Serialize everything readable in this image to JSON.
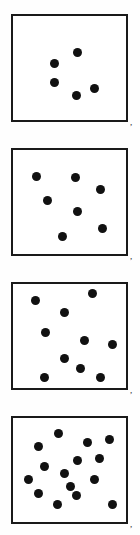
{
  "figure": {
    "title": "Dot density stimulus panels",
    "background_color": "#ffffff",
    "border_color": "#1a1a1a",
    "dot_color": "#111111",
    "separator_label": ","
  },
  "chart_data": {
    "type": "scatter",
    "title": "Dot density stimulus panels",
    "subtitle": "",
    "xlabel": "",
    "ylabel": "",
    "grid": false,
    "legend": "none",
    "xlim": [
      0,
      100
    ],
    "ylim": [
      0,
      100
    ],
    "categories": [
      "Panel 1",
      "Panel 2",
      "Panel 3",
      "Panel 4"
    ],
    "values": [
      5,
      7,
      10,
      15
    ],
    "series": [
      {
        "name": "Panel 1",
        "count": 5,
        "frame": {
          "x": 11,
          "y": 14,
          "width": 117,
          "height": 108
        },
        "dot_radius": 4.5,
        "points": [
          {
            "x": 75,
            "y": 50
          },
          {
            "x": 52,
            "y": 61
          },
          {
            "x": 52,
            "y": 80
          },
          {
            "x": 74,
            "y": 93
          },
          {
            "x": 92,
            "y": 86
          }
        ]
      },
      {
        "name": "Panel 2",
        "count": 7,
        "frame": {
          "x": 11,
          "y": 148,
          "width": 117,
          "height": 108
        },
        "dot_radius": 4.5,
        "points": [
          {
            "x": 34,
            "y": 174
          },
          {
            "x": 73,
            "y": 175
          },
          {
            "x": 98,
            "y": 187
          },
          {
            "x": 45,
            "y": 198
          },
          {
            "x": 75,
            "y": 209
          },
          {
            "x": 100,
            "y": 226
          },
          {
            "x": 60,
            "y": 234
          }
        ]
      },
      {
        "name": "Panel 3",
        "count": 10,
        "frame": {
          "x": 11,
          "y": 282,
          "width": 117,
          "height": 108
        },
        "dot_radius": 4.5,
        "points": [
          {
            "x": 90,
            "y": 291
          },
          {
            "x": 33,
            "y": 298
          },
          {
            "x": 62,
            "y": 310
          },
          {
            "x": 43,
            "y": 330
          },
          {
            "x": 82,
            "y": 338
          },
          {
            "x": 110,
            "y": 342
          },
          {
            "x": 62,
            "y": 356
          },
          {
            "x": 78,
            "y": 366
          },
          {
            "x": 98,
            "y": 375
          },
          {
            "x": 42,
            "y": 375
          }
        ]
      },
      {
        "name": "Panel 4",
        "count": 15,
        "frame": {
          "x": 11,
          "y": 416,
          "width": 117,
          "height": 108
        },
        "dot_radius": 4.5,
        "points": [
          {
            "x": 56,
            "y": 431
          },
          {
            "x": 85,
            "y": 440
          },
          {
            "x": 107,
            "y": 437
          },
          {
            "x": 36,
            "y": 444
          },
          {
            "x": 75,
            "y": 458
          },
          {
            "x": 97,
            "y": 456
          },
          {
            "x": 42,
            "y": 464
          },
          {
            "x": 62,
            "y": 471
          },
          {
            "x": 92,
            "y": 477
          },
          {
            "x": 36,
            "y": 491
          },
          {
            "x": 74,
            "y": 493
          },
          {
            "x": 55,
            "y": 502
          },
          {
            "x": 110,
            "y": 502
          },
          {
            "x": 26,
            "y": 477
          },
          {
            "x": 68,
            "y": 484
          }
        ]
      }
    ],
    "annotations": [
      {
        "text": ",",
        "x": 130,
        "y": 118
      },
      {
        "text": ",",
        "x": 130,
        "y": 252
      },
      {
        "text": ",",
        "x": 130,
        "y": 386
      },
      {
        "text": ",",
        "x": 130,
        "y": 520
      }
    ]
  }
}
